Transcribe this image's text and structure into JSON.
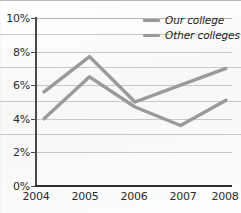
{
  "chart_data": {
    "type": "line",
    "title": "",
    "subtitle": "",
    "xlabel": "",
    "ylabel": "",
    "categories": [
      "2004",
      "2005",
      "2006",
      "2007",
      "2008"
    ],
    "x": [
      2004,
      2005,
      2006,
      2007,
      2008
    ],
    "series": [
      {
        "name": "Our college",
        "values": [
          5.6,
          7.7,
          5.0,
          6.0,
          7.0
        ],
        "color": "#9a9a9a"
      },
      {
        "name": "Other colleges",
        "values": [
          4.0,
          6.5,
          4.7,
          3.6,
          5.1
        ],
        "color": "#9a9a9a"
      }
    ],
    "ylim": [
      0,
      10
    ],
    "y_ticks": [
      0,
      2,
      4,
      6,
      8,
      10
    ],
    "y_tick_labels": [
      "0%",
      "2%",
      "4%",
      "6%",
      "8%",
      "10%"
    ],
    "xlim": [
      2004,
      2008
    ],
    "grid": true,
    "grid_axis": "y",
    "legend_position": "top-right",
    "value_format": "percent"
  },
  "legend": {
    "entries": [
      {
        "label": "Our college",
        "swatch_color": "#9a9a9a"
      },
      {
        "label": "Other colleges",
        "swatch_color": "#9a9a9a"
      }
    ]
  },
  "axes": {
    "y_labels": [
      "10%",
      "8%",
      "6%",
      "4%",
      "2%",
      "0%"
    ],
    "x_labels": [
      "2004",
      "2005",
      "2006",
      "2007",
      "2008"
    ]
  },
  "colors": {
    "line": "#9a9a9a",
    "line_dark": "#8e8e8e",
    "gridline": "#c9c9c9",
    "axis": "#2e2e2e",
    "text": "#2b2b2b",
    "background": "#fbfbfa"
  }
}
